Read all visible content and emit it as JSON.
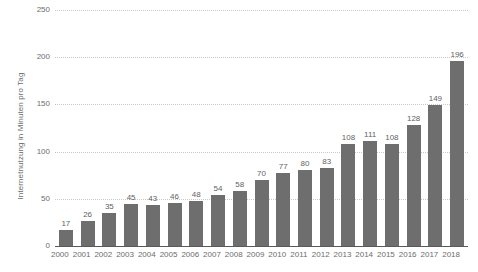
{
  "chart_data": {
    "type": "bar",
    "title": "",
    "xlabel": "",
    "ylabel": "Internetnutzung in Minuten pro Tag",
    "ylim": [
      0,
      250
    ],
    "yticks": [
      0,
      50,
      100,
      150,
      200,
      250
    ],
    "ytick_labels": [
      "0",
      "50",
      "100",
      "150",
      "200",
      "250"
    ],
    "grid": true,
    "grid_style": "dotted",
    "legend": "none",
    "bar_color": "#6e6e6e",
    "background_color": "#ffffff",
    "text_color": "#6d6d6d",
    "show_data_labels": true,
    "categories": [
      "2000",
      "2001",
      "2002",
      "2003",
      "2004",
      "2005",
      "2006",
      "2007",
      "2008",
      "2009",
      "2010",
      "2011",
      "2012",
      "2013",
      "2014",
      "2015",
      "2016",
      "2017",
      "2018"
    ],
    "values": [
      17,
      26,
      35,
      45,
      43,
      46,
      48,
      54,
      58,
      70,
      77,
      80,
      83,
      108,
      111,
      108,
      128,
      149,
      196
    ],
    "value_labels": [
      "17",
      "26",
      "35",
      "45",
      "43",
      "46",
      "48",
      "54",
      "58",
      "70",
      "77",
      "80",
      "83",
      "108",
      "111",
      "108",
      "128",
      "149",
      "196"
    ]
  }
}
